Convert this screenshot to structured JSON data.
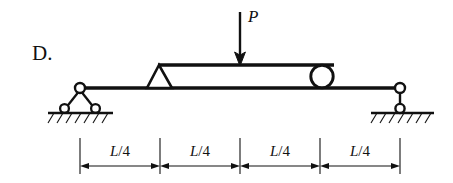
{
  "figure": {
    "choice_label": "D.",
    "load_label": "P",
    "caption_kind": "beam-free-body-diagram"
  },
  "dimensions": {
    "segments": [
      {
        "label_num": "L",
        "label_sep": "/4",
        "full": "L/4"
      },
      {
        "label_num": "L",
        "label_sep": "/4",
        "full": "L/4"
      },
      {
        "label_num": "L",
        "label_sep": "/4",
        "full": "L/4"
      },
      {
        "label_num": "L",
        "label_sep": "/4",
        "full": "L/4"
      }
    ]
  },
  "colors": {
    "ink": "#111111",
    "paper": "#ffffff"
  },
  "geometry": {
    "span_left_x": 80,
    "span_right_x": 400,
    "beam_y": 88,
    "upper_member_y": 65,
    "quarter_marks": [
      80,
      160,
      240,
      320,
      400
    ],
    "dim_line_y": 166,
    "ground_y": 113
  },
  "elements": {
    "left_support": "pinned-rocker-support",
    "right_support": "link-roller-support",
    "internal_hinge_triangle": "triangular-knife-support",
    "internal_roller_circle": "circular-roller",
    "load_arrow": "downward-point-load-arrow",
    "ground_hatch": "ground-hatching"
  }
}
